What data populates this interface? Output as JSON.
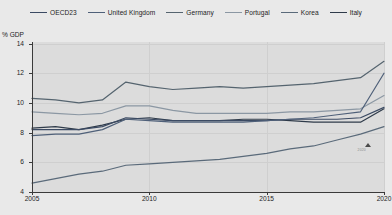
{
  "legend": {
    "items": [
      {
        "label": "OECD23",
        "color": "#3b4a63"
      },
      {
        "label": "United Kingdom",
        "color": "#4f6079"
      },
      {
        "label": "Germany",
        "color": "#55646f"
      },
      {
        "label": "Portugal",
        "color": "#8b97a3"
      },
      {
        "label": "Korea",
        "color": "#5a6a7a"
      },
      {
        "label": "Italy",
        "color": "#2f3b4a"
      }
    ]
  },
  "axes": {
    "y_title": "% GDP",
    "y_ticks": [
      "14",
      "12",
      "10",
      "8",
      "6",
      "4"
    ],
    "x_ticks": [
      "2005",
      "2010",
      "2015",
      "2020"
    ]
  },
  "annotation": {
    "marker": "triangle-marker",
    "text": "2020"
  },
  "chart_data": {
    "type": "line",
    "title": "",
    "subtitle": "",
    "xlabel": "",
    "ylabel": "% GDP",
    "xlim": [
      2005,
      2020
    ],
    "ylim": [
      4,
      14.1
    ],
    "grid": true,
    "legend_position": "top",
    "x": [
      2005,
      2006,
      2007,
      2008,
      2009,
      2010,
      2011,
      2012,
      2013,
      2014,
      2015,
      2016,
      2017,
      2018,
      2019,
      2020
    ],
    "series": [
      {
        "name": "Germany",
        "color": "#55646f",
        "values": [
          10.3,
          10.2,
          10.0,
          10.2,
          11.4,
          11.1,
          10.9,
          11.0,
          11.1,
          11.0,
          11.1,
          11.2,
          11.3,
          11.5,
          11.7,
          12.8
        ]
      },
      {
        "name": "Portugal",
        "color": "#8b97a3",
        "values": [
          9.4,
          9.3,
          9.2,
          9.3,
          9.8,
          9.8,
          9.5,
          9.3,
          9.3,
          9.3,
          9.3,
          9.4,
          9.4,
          9.5,
          9.6,
          10.5
        ]
      },
      {
        "name": "Italy",
        "color": "#2f3b4a",
        "values": [
          8.3,
          8.4,
          8.2,
          8.5,
          8.9,
          9.0,
          8.8,
          8.8,
          8.8,
          8.9,
          8.9,
          8.8,
          8.7,
          8.7,
          8.7,
          9.6
        ]
      },
      {
        "name": "OECD23",
        "color": "#3b4a63",
        "values": [
          8.2,
          8.2,
          8.2,
          8.4,
          9.0,
          8.9,
          8.8,
          8.8,
          8.8,
          8.8,
          8.8,
          8.9,
          8.9,
          8.9,
          9.0,
          9.7
        ]
      },
      {
        "name": "United Kingdom",
        "color": "#4f6079",
        "values": [
          7.8,
          7.9,
          7.9,
          8.2,
          8.9,
          8.8,
          8.7,
          8.7,
          8.7,
          8.7,
          8.8,
          8.9,
          9.0,
          9.2,
          9.4,
          12.0
        ]
      },
      {
        "name": "Korea",
        "color": "#5a6a7a",
        "values": [
          4.6,
          4.9,
          5.2,
          5.4,
          5.8,
          5.9,
          6.0,
          6.1,
          6.2,
          6.4,
          6.6,
          6.9,
          7.1,
          7.5,
          7.9,
          8.4
        ]
      }
    ]
  }
}
